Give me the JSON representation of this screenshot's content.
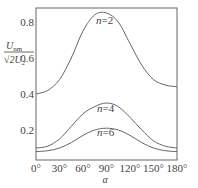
{
  "chart_data": {
    "type": "line",
    "title": "",
    "xlabel": "α",
    "ylabel": "U_nm / (√2 U_2)",
    "ylabel_parts": {
      "num": "U",
      "num_sub": "nm",
      "den_prefix": "√2",
      "den": "U",
      "den_sub": "2"
    },
    "xlim": [
      0,
      180
    ],
    "ylim": [
      0.03,
      0.87
    ],
    "grid": false,
    "legend_position": "inline labels",
    "x_ticks": [
      0,
      30,
      60,
      90,
      120,
      150,
      180
    ],
    "x_tick_labels": [
      "0°",
      "30°",
      "60°",
      "90°",
      "120°",
      "150°",
      "180°"
    ],
    "y_ticks": [
      0.2,
      0.4,
      0.6,
      0.8
    ],
    "y_tick_labels": [
      "0.2",
      "0.4",
      "0.6",
      "0.8"
    ],
    "x": [
      0,
      15,
      30,
      45,
      60,
      75,
      90,
      105,
      120,
      135,
      150,
      165,
      180
    ],
    "series": [
      {
        "name": "n=2",
        "label": "n=2",
        "values": [
          0.4,
          0.42,
          0.48,
          0.6,
          0.75,
          0.84,
          0.85,
          0.8,
          0.68,
          0.56,
          0.48,
          0.45,
          0.44
        ]
      },
      {
        "name": "n=4",
        "label": "n=4",
        "values": [
          0.1,
          0.11,
          0.15,
          0.22,
          0.29,
          0.33,
          0.35,
          0.33,
          0.27,
          0.2,
          0.14,
          0.11,
          0.1
        ]
      },
      {
        "name": "n=6",
        "label": "n=6",
        "values": [
          0.08,
          0.085,
          0.1,
          0.13,
          0.17,
          0.2,
          0.21,
          0.2,
          0.17,
          0.13,
          0.1,
          0.085,
          0.08
        ]
      }
    ]
  },
  "axis": {
    "x_label": "α",
    "y_label_num": "U",
    "y_label_num_sub": "nm",
    "y_label_den": "√2U",
    "y_label_den_sub": "2"
  }
}
